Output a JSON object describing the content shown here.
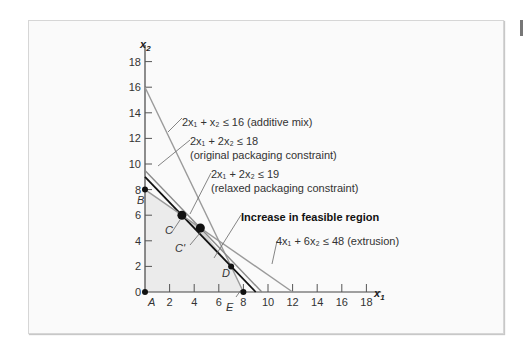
{
  "chart_data": {
    "type": "line",
    "title": "",
    "xlabel": "x1",
    "ylabel": "x2",
    "xlim": [
      0,
      19
    ],
    "ylim": [
      0,
      19
    ],
    "x_ticks": [
      0,
      2,
      4,
      6,
      8,
      10,
      12,
      14,
      16,
      18
    ],
    "y_ticks": [
      0,
      2,
      4,
      6,
      8,
      10,
      12,
      14,
      16,
      18
    ],
    "grid": false,
    "series": [
      {
        "name": "2x1 + x2 ≤ 16 (additive mix)",
        "points": [
          [
            0,
            16
          ],
          [
            8,
            0
          ]
        ],
        "color": "#9a9a9a"
      },
      {
        "name": "2x1 + 2x2 ≤ 18 (original packaging constraint)",
        "points": [
          [
            0,
            9
          ],
          [
            9,
            0
          ]
        ],
        "color": "#111111"
      },
      {
        "name": "2x1 + 2x2 ≤ 19 (relaxed packaging constraint)",
        "points": [
          [
            0,
            9.5
          ],
          [
            9.5,
            0
          ]
        ],
        "color": "#8a8a8a"
      },
      {
        "name": "4x1 + 6x2 ≤ 48 (extrusion)",
        "points": [
          [
            0,
            8
          ],
          [
            12,
            0
          ]
        ],
        "color": "#9a9a9a"
      }
    ],
    "feasible_region": [
      [
        0,
        0
      ],
      [
        0,
        8
      ],
      [
        3,
        6
      ],
      [
        7,
        2
      ],
      [
        8,
        0
      ]
    ],
    "increase_region": [
      [
        3,
        6
      ],
      [
        4.5,
        5
      ],
      [
        7,
        2
      ]
    ],
    "points": [
      {
        "label": "A",
        "x": 0,
        "y": 0,
        "size": "small"
      },
      {
        "label": "B",
        "x": 0,
        "y": 8,
        "size": "small"
      },
      {
        "label": "C",
        "x": 3,
        "y": 6,
        "size": "large"
      },
      {
        "label": "C'",
        "x": 4.5,
        "y": 5,
        "size": "large"
      },
      {
        "label": "D",
        "x": 7,
        "y": 2,
        "size": "small"
      },
      {
        "label": "E",
        "x": 8,
        "y": 0,
        "size": "small"
      }
    ],
    "annotations": [
      {
        "text_parts": [
          "2x",
          "1",
          " + x",
          "2",
          " ≤ 16 (additive mix)"
        ],
        "x": 182,
        "y": 122
      },
      {
        "text_parts": [
          "2x",
          "1",
          " + 2x",
          "2",
          " ≤ 18"
        ],
        "x": 190,
        "y": 145
      },
      {
        "text": "(original packaging constraint)",
        "x": 190,
        "y": 159
      },
      {
        "text_parts": [
          "2x",
          "1",
          " + 2x",
          "2",
          " ≤ 19"
        ],
        "x": 211,
        "y": 177
      },
      {
        "text": "(relaxed packaging constraint)",
        "x": 211,
        "y": 191
      },
      {
        "text": "Increase in feasible region",
        "x": 241,
        "y": 219,
        "bold": true
      },
      {
        "text_parts": [
          "4x",
          "1",
          " + 6x",
          "2",
          "  ≤ 48 (extrusion)"
        ],
        "x": 277,
        "y": 245
      }
    ]
  },
  "labels": {
    "x_axis": "x",
    "x_axis_sub": "1",
    "y_axis": "x",
    "y_axis_sub": "2",
    "ann_additive": "2x₁ + x₂ ≤ 16 (additive mix)",
    "ann_orig_1": "2x₁ + 2x₂ ≤ 18",
    "ann_orig_2": "(original packaging constraint)",
    "ann_relax_1": "2x₁ + 2x₂ ≤ 19",
    "ann_relax_2": "(relaxed packaging constraint)",
    "ann_increase": "Increase in feasible region",
    "ann_extrusion": "4x₁ + 6x₂  ≤ 48 (extrusion)",
    "pt_A": "A",
    "pt_B": "B",
    "pt_C": "C",
    "pt_C2": "C'",
    "pt_D": "D",
    "pt_E": "E"
  },
  "colors": {
    "shade": "#ebebeb",
    "gray_line": "#9a9a9a",
    "black_line": "#111111"
  }
}
